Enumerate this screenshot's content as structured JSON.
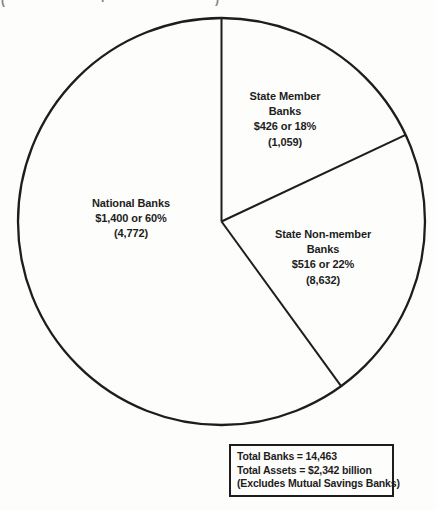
{
  "page": {
    "background": "#fdfdfc",
    "ink_color": "#1d1d1d"
  },
  "artifacts": {
    "glyphs": [
      "(",
      ".",
      ")"
    ]
  },
  "chart_data": {
    "type": "pie",
    "title": "",
    "fill": "none",
    "stroke_color": "#1d1d1d",
    "direction": "clockwise",
    "start_angle_from_north_deg": 0,
    "slices": [
      {
        "label": "State Member Banks",
        "percent": 18,
        "assets_text": "$426",
        "banks_count": 1059,
        "lines": [
          "State Member",
          "Banks",
          "$426 or 18%",
          "(1,059)"
        ]
      },
      {
        "label": "State Non-member Banks",
        "percent": 22,
        "assets_text": "$516",
        "banks_count": 8632,
        "lines": [
          "State Non-member",
          "Banks",
          "$516 or 22%",
          "(8,632)"
        ]
      },
      {
        "label": "National Banks",
        "percent": 60,
        "assets_text": "$1,400",
        "banks_count": 4772,
        "lines": [
          "National Banks",
          "$1,400 or 60%",
          "(4,772)"
        ]
      }
    ],
    "totals_box": {
      "total_banks": 14463,
      "total_assets_text": "$2,342 billion",
      "lines": [
        "Total Banks = 14,463",
        "Total Assets = $2,342 billion",
        "(Excludes Mutual Savings Banks)"
      ]
    }
  }
}
